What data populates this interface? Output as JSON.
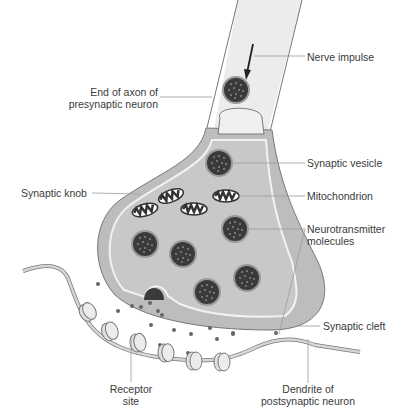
{
  "diagram": {
    "colors": {
      "axon_fill": "#e8e8e8",
      "knob_fill": "#bdbdbd",
      "knob_inner_fill": "#c9c9c9",
      "vesicle_fill": "#3a3a3a",
      "dendrite_fill": "#cfcfcf",
      "outline": "#6e6e6e",
      "leader_line": "#9a9a9a",
      "text": "#3a3a3a"
    },
    "labels": {
      "nerve_impulse": "Nerve impulse",
      "axon_end_line1": "End of axon of",
      "axon_end_line2": "presynaptic neuron",
      "synaptic_vesicle": "Synaptic vesicle",
      "synaptic_knob": "Synaptic knob",
      "mitochondrion": "Mitochondrion",
      "neurotransmitter_line1": "Neurotransmitter",
      "neurotransmitter_line2": "molecules",
      "synaptic_cleft": "Synaptic cleft",
      "receptor_line1": "Receptor",
      "receptor_line2": "site",
      "dendrite_line1": "Dendrite of",
      "dendrite_line2": "postsynaptic neuron"
    }
  }
}
